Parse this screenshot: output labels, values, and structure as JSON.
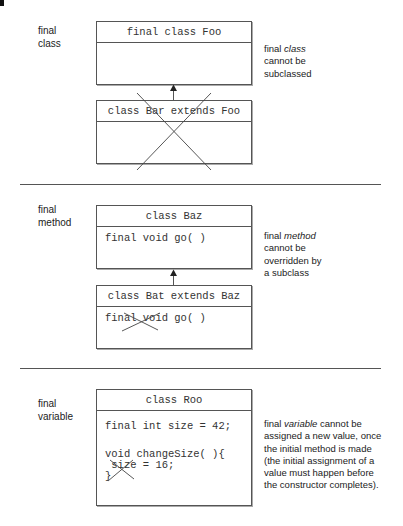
{
  "sections": [
    {
      "label_line1": "final",
      "label_line2": "class",
      "note_prefix": "final ",
      "note_em": "class",
      "note_rest_lines": [
        "cannot be",
        "subclassed"
      ],
      "superclass": {
        "header": "final class Foo",
        "body_lines": []
      },
      "subclass": {
        "header": "class Bar extends Foo",
        "body_lines": []
      }
    },
    {
      "label_line1": "final",
      "label_line2": "method",
      "note_prefix": "final ",
      "note_em": "method",
      "note_rest_lines": [
        "cannot be",
        "overridden by",
        "a subclass"
      ],
      "superclass": {
        "header": "class Baz",
        "body_lines": [
          "final void go( )"
        ]
      },
      "subclass": {
        "header": "class Bat extends Baz",
        "body_lines": [
          "final void go( )"
        ]
      }
    },
    {
      "label_line1": "final",
      "label_line2": "variable",
      "note_prefix": "final ",
      "note_em": "variable",
      "note_first_suffix": " cannot be",
      "note_rest_lines": [
        "assigned a new value, once",
        "the initial method is made",
        "(the initial assignment of a",
        "value must happen before",
        "the constructor completes)."
      ],
      "class": {
        "header": "class Roo",
        "body_line1": "final int size = 42;",
        "body_line2": "void changeSize( ){",
        "body_line3": " size = 16;",
        "body_line4": "}"
      }
    }
  ],
  "colors": {
    "line": "#555555",
    "cross": "#444444",
    "text": "#222222"
  }
}
